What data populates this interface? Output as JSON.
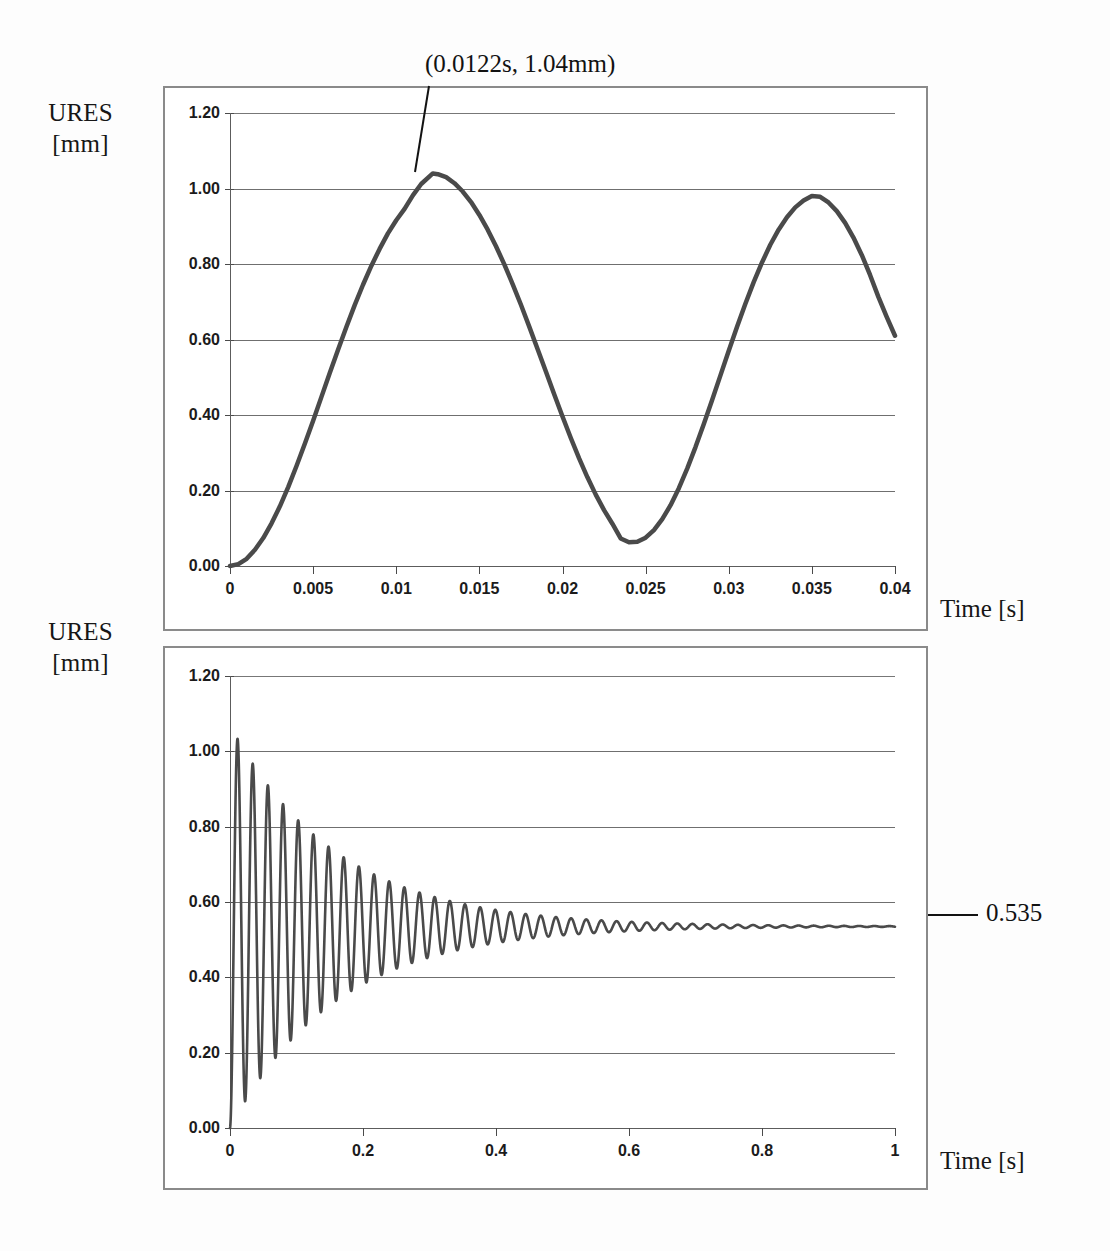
{
  "figure": {
    "background_color": "#fdfdfd",
    "curve_color": "#4a4a4a",
    "grid_color": "#6f6f6f",
    "frame_color": "#8a8a8a"
  },
  "top_chart": {
    "y_axis_title": "URES\n[mm]",
    "x_axis_title": "Time [s]",
    "annotation": {
      "label": "(0.0122s, 1.04mm)",
      "point_time": 0.0122,
      "point_value": 1.04
    }
  },
  "bottom_chart": {
    "y_axis_title": "URES\n[mm]",
    "x_axis_title": "Time [s]",
    "annotation": {
      "label": "0.535",
      "value": 0.535
    }
  },
  "chart_data": [
    {
      "type": "line",
      "title": "",
      "subtitle": "",
      "xlabel": "Time [s]",
      "ylabel": "URES [mm]",
      "xlim": [
        0,
        0.04
      ],
      "ylim": [
        0,
        1.2
      ],
      "grid": true,
      "legend": "none",
      "xticks": [
        "0",
        "0.005",
        "0.01",
        "0.015",
        "0.02",
        "0.025",
        "0.03",
        "0.035",
        "0.04"
      ],
      "xtick_values": [
        0,
        0.005,
        0.01,
        0.015,
        0.02,
        0.025,
        0.03,
        0.035,
        0.04
      ],
      "yticks": [
        "0.00",
        "0.20",
        "0.40",
        "0.60",
        "0.80",
        "1.00",
        "1.20"
      ],
      "ytick_values": [
        0.0,
        0.2,
        0.4,
        0.6,
        0.8,
        1.0,
        1.2
      ],
      "annotations": [
        {
          "text": "(0.0122s, 1.04mm)",
          "x": 0.0122,
          "y": 1.04
        }
      ],
      "series": [
        {
          "name": "URES",
          "x": [
            0,
            0.0005,
            0.001,
            0.0015,
            0.002,
            0.0025,
            0.003,
            0.0035,
            0.004,
            0.0045,
            0.005,
            0.0055,
            0.006,
            0.0065,
            0.007,
            0.0075,
            0.008,
            0.0085,
            0.009,
            0.0095,
            0.01,
            0.0105,
            0.011,
            0.0115,
            0.0122,
            0.0125,
            0.013,
            0.0135,
            0.014,
            0.0145,
            0.015,
            0.0155,
            0.016,
            0.0165,
            0.017,
            0.0175,
            0.018,
            0.0185,
            0.019,
            0.0195,
            0.02,
            0.0205,
            0.021,
            0.0215,
            0.022,
            0.0225,
            0.023,
            0.0235,
            0.024,
            0.0245,
            0.025,
            0.0255,
            0.026,
            0.0265,
            0.027,
            0.0275,
            0.028,
            0.0285,
            0.029,
            0.0295,
            0.03,
            0.0305,
            0.031,
            0.0315,
            0.032,
            0.0325,
            0.033,
            0.0335,
            0.034,
            0.0345,
            0.035,
            0.0355,
            0.036,
            0.0365,
            0.037,
            0.0375,
            0.038,
            0.0385,
            0.039,
            0.0395,
            0.04
          ],
          "y": [
            0.0,
            0.005,
            0.019,
            0.043,
            0.074,
            0.113,
            0.158,
            0.209,
            0.265,
            0.324,
            0.385,
            0.448,
            0.511,
            0.573,
            0.633,
            0.691,
            0.745,
            0.795,
            0.84,
            0.881,
            0.916,
            0.946,
            0.982,
            1.012,
            1.04,
            1.038,
            1.03,
            1.014,
            0.992,
            0.964,
            0.93,
            0.891,
            0.847,
            0.799,
            0.747,
            0.692,
            0.634,
            0.575,
            0.515,
            0.455,
            0.396,
            0.339,
            0.285,
            0.235,
            0.189,
            0.148,
            0.112,
            0.073,
            0.063,
            0.064,
            0.075,
            0.095,
            0.124,
            0.161,
            0.206,
            0.258,
            0.315,
            0.376,
            0.44,
            0.505,
            0.57,
            0.634,
            0.695,
            0.752,
            0.804,
            0.851,
            0.891,
            0.924,
            0.95,
            0.968,
            0.98,
            0.978,
            0.963,
            0.94,
            0.909,
            0.87,
            0.824,
            0.771,
            0.713,
            0.66,
            0.61
          ]
        }
      ]
    },
    {
      "type": "line",
      "title": "",
      "subtitle": "",
      "xlabel": "Time [s]",
      "ylabel": "URES [mm]",
      "xlim": [
        0,
        1
      ],
      "ylim": [
        0,
        1.2
      ],
      "grid": true,
      "legend": "none",
      "xticks": [
        "0",
        "0.2",
        "0.4",
        "0.6",
        "0.8",
        "1"
      ],
      "xtick_values": [
        0,
        0.2,
        0.4,
        0.6,
        0.8,
        1
      ],
      "yticks": [
        "0.00",
        "0.20",
        "0.40",
        "0.60",
        "0.80",
        "1.00",
        "1.20"
      ],
      "ytick_values": [
        0.0,
        0.2,
        0.4,
        0.6,
        0.8,
        1.0,
        1.2
      ],
      "annotations": [
        {
          "text": "0.535",
          "x": 1.0,
          "y": 0.535
        }
      ],
      "description": "Damped oscillation about steady-state 0.535 mm; first peak 1.04 mm at 0.0122 s; period approximately 0.0228 s; amplitude decays exponentially to near zero by 1 s.",
      "model": {
        "steady_state": 0.535,
        "initial_amplitude": 0.535,
        "period_s": 0.0228,
        "decay_time_constant_s": 0.16,
        "start_value": 0.0
      }
    }
  ]
}
